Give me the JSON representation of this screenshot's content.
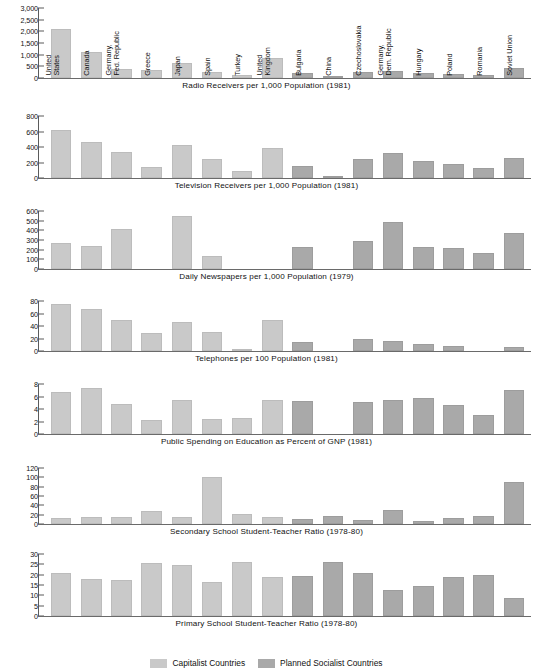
{
  "figure": {
    "countries": [
      "United\nStates",
      "Canada",
      "Germany,\nFed. Republic",
      "Greece",
      "Japan",
      "Spain",
      "Turkey",
      "United\nKingdom",
      "Bulgaria",
      "China",
      "Czechoslovakia",
      "Germany,\nDem. Republic",
      "Hungary",
      "Poland",
      "Romania",
      "Soviet Union"
    ],
    "groups": [
      "cap",
      "cap",
      "cap",
      "cap",
      "cap",
      "cap",
      "cap",
      "cap",
      "soc",
      "soc",
      "soc",
      "soc",
      "soc",
      "soc",
      "soc",
      "soc"
    ],
    "legend": [
      {
        "label": "Capitalist Countries",
        "color": "#c9c9c9",
        "key": "cap"
      },
      {
        "label": "Planned Socialist Countries",
        "color": "#a9a9a9",
        "key": "soc"
      }
    ]
  },
  "chart_data": [
    {
      "type": "bar",
      "title": "Radio Receivers per 1,000 Population (1981)",
      "xlabel": "",
      "ylabel": "",
      "ylim": [
        0,
        3000
      ],
      "yticks": [
        0,
        500,
        1000,
        1500,
        2000,
        2500,
        3000
      ],
      "ytick_labels": [
        "0",
        "500",
        "1,000",
        "1,500",
        "2,000",
        "2,500",
        "3,000"
      ],
      "categories": [
        "United States",
        "Canada",
        "Germany, Fed. Republic",
        "Greece",
        "Japan",
        "Spain",
        "Turkey",
        "United Kingdom",
        "Bulgaria",
        "China",
        "Czechoslovakia",
        "Germany, Dem. Republic",
        "Hungary",
        "Poland",
        "Romania",
        "Soviet Union"
      ],
      "values": [
        2100,
        1130,
        370,
        340,
        660,
        250,
        120,
        850,
        220,
        20,
        270,
        280,
        220,
        190,
        150,
        420
      ],
      "grid": false,
      "legend_position": "bottom"
    },
    {
      "type": "bar",
      "title": "Television Receivers per 1,000 Population (1981)",
      "xlabel": "",
      "ylabel": "",
      "ylim": [
        0,
        800
      ],
      "yticks": [
        0,
        200,
        400,
        600,
        800
      ],
      "ytick_labels": [
        "0",
        "200",
        "400",
        "600",
        "800"
      ],
      "categories": [
        "United States",
        "Canada",
        "Germany, Fed. Republic",
        "Greece",
        "Japan",
        "Spain",
        "Turkey",
        "United Kingdom",
        "Bulgaria",
        "China",
        "Czechoslovakia",
        "Germany, Dem. Republic",
        "Hungary",
        "Poland",
        "Romania",
        "Soviet Union"
      ],
      "values": [
        620,
        470,
        330,
        145,
        420,
        245,
        85,
        390,
        150,
        8,
        250,
        320,
        215,
        185,
        130,
        260
      ],
      "grid": false,
      "legend_position": "bottom"
    },
    {
      "type": "bar",
      "title": "Daily Newspapers per 1,000 Population (1979)",
      "xlabel": "",
      "ylabel": "",
      "ylim": [
        0,
        600
      ],
      "yticks": [
        0,
        100,
        200,
        300,
        400,
        500,
        600
      ],
      "ytick_labels": [
        "0",
        "100",
        "200",
        "300",
        "400",
        "500",
        "600"
      ],
      "categories": [
        "United States",
        "Canada",
        "Germany, Fed. Republic",
        "Greece",
        "Japan",
        "Spain",
        "Turkey",
        "United Kingdom",
        "Bulgaria",
        "China",
        "Czechoslovakia",
        "Germany, Dem. Republic",
        "Hungary",
        "Poland",
        "Romania",
        "Soviet Union"
      ],
      "values": [
        270,
        235,
        410,
        0,
        550,
        130,
        0,
        0,
        225,
        0,
        285,
        490,
        230,
        215,
        170,
        370
      ],
      "grid": false,
      "legend_position": "bottom"
    },
    {
      "type": "bar",
      "title": "Telephones per 100 Population (1981)",
      "xlabel": "",
      "ylabel": "",
      "ylim": [
        0,
        80
      ],
      "yticks": [
        0,
        20,
        40,
        60,
        80
      ],
      "ytick_labels": [
        "0",
        "20",
        "40",
        "60",
        "80"
      ],
      "categories": [
        "United States",
        "Canada",
        "Germany, Fed. Republic",
        "Greece",
        "Japan",
        "Spain",
        "Turkey",
        "United Kingdom",
        "Bulgaria",
        "China",
        "Czechoslovakia",
        "Germany, Dem. Republic",
        "Hungary",
        "Poland",
        "Romania",
        "Soviet Union"
      ],
      "values": [
        76,
        68,
        50,
        29,
        47,
        31,
        4,
        49,
        15,
        0,
        20,
        16,
        11,
        8,
        0,
        7
      ],
      "grid": false,
      "legend_position": "bottom"
    },
    {
      "type": "bar",
      "title": "Public Spending on Education as Percent of GNP (1981)",
      "xlabel": "",
      "ylabel": "",
      "ylim": [
        0,
        8
      ],
      "yticks": [
        0,
        2,
        4,
        6,
        8
      ],
      "ytick_labels": [
        "0",
        "2",
        "4",
        "6",
        "8"
      ],
      "categories": [
        "United States",
        "Canada",
        "Germany, Fed. Republic",
        "Greece",
        "Japan",
        "Spain",
        "Turkey",
        "United Kingdom",
        "Bulgaria",
        "China",
        "Czechoslovakia",
        "Germany, Dem. Republic",
        "Hungary",
        "Poland",
        "Romania",
        "Soviet Union"
      ],
      "values": [
        6.8,
        7.4,
        4.8,
        2.2,
        5.5,
        2.4,
        2.6,
        5.5,
        5.3,
        0,
        5.1,
        5.4,
        5.7,
        4.7,
        3.0,
        7.1
      ],
      "grid": false,
      "legend_position": "bottom"
    },
    {
      "type": "bar",
      "title": "Secondary School Student-Teacher Ratio (1978-80)",
      "xlabel": "",
      "ylabel": "",
      "ylim": [
        0,
        120
      ],
      "yticks": [
        0,
        20,
        40,
        60,
        80,
        100,
        120
      ],
      "ytick_labels": [
        "0",
        "20",
        "40",
        "60",
        "80",
        "100",
        "120"
      ],
      "categories": [
        "United States",
        "Canada",
        "Germany, Fed. Republic",
        "Greece",
        "Japan",
        "Spain",
        "Turkey",
        "United Kingdom",
        "Bulgaria",
        "China",
        "Czechoslovakia",
        "Germany, Dem. Republic",
        "Hungary",
        "Poland",
        "Romania",
        "Soviet Union"
      ],
      "values": [
        12,
        16,
        14,
        27,
        16,
        100,
        21,
        15,
        11,
        17,
        9,
        30,
        7,
        12,
        17,
        89
      ],
      "grid": false,
      "legend_position": "bottom"
    },
    {
      "type": "bar",
      "title": "Primary School Student-Teacher Ratio (1978-80)",
      "xlabel": "",
      "ylabel": "",
      "ylim": [
        0,
        30
      ],
      "yticks": [
        0,
        5,
        10,
        15,
        20,
        25,
        30
      ],
      "ytick_labels": [
        "0",
        "5",
        "10",
        "15",
        "20",
        "25",
        "30"
      ],
      "categories": [
        "United States",
        "Canada",
        "Germany, Fed. Republic",
        "Greece",
        "Japan",
        "Spain",
        "Turkey",
        "United Kingdom",
        "Bulgaria",
        "China",
        "Czechoslovakia",
        "Germany, Dem. Republic",
        "Hungary",
        "Poland",
        "Romania",
        "Soviet Union"
      ],
      "values": [
        21,
        17.7,
        17.3,
        25.5,
        24.8,
        16.6,
        26.2,
        19,
        19.4,
        26.2,
        20.7,
        12.5,
        14.7,
        18.8,
        19.8,
        8.5
      ],
      "grid": false,
      "legend_position": "bottom"
    }
  ]
}
